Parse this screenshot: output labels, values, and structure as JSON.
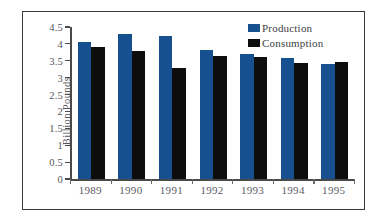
{
  "chart_data": {
    "type": "bar",
    "title": "",
    "xlabel": "",
    "ylabel": "Billion Pounds",
    "categories": [
      "1989",
      "1990",
      "1991",
      "1992",
      "1993",
      "1994",
      "1995"
    ],
    "series": [
      {
        "name": "Production",
        "color": "#17508f",
        "values": [
          4.07,
          4.3,
          4.23,
          3.81,
          3.7,
          3.58,
          3.41
        ]
      },
      {
        "name": "Consumption",
        "color": "#0d0d0d",
        "values": [
          3.92,
          3.79,
          3.3,
          3.64,
          3.61,
          3.44,
          3.45
        ]
      }
    ],
    "ylim": [
      0,
      4.5
    ],
    "ytick_labels": [
      "4.5",
      "4",
      "3.5",
      "3",
      "2.5",
      "2",
      "1.5",
      "1",
      "0.5",
      "0"
    ],
    "ytick_values": [
      4.5,
      4,
      3.5,
      3,
      2.5,
      2,
      1.5,
      1,
      0.5,
      0
    ],
    "grid": false,
    "legend_position": "top-right"
  }
}
